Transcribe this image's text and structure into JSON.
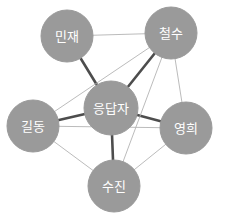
{
  "figure": {
    "type": "network-graph",
    "background_color": "#ffffff",
    "width": 225,
    "height": 224
  },
  "style": {
    "node_fill": "#9a9a9a",
    "node_stroke": "#9a9a9a",
    "node_label_color": "#ffffff",
    "edge_strong_color": "#4d4d4d",
    "edge_weak_color": "#b3b3b3",
    "edge_strong_width": 2.6,
    "edge_weak_width": 0.9
  },
  "chart_data": {
    "type": "network",
    "title": "",
    "nodes": [
      {
        "id": "minjae",
        "label": "민재",
        "x": 67,
        "y": 36,
        "r": 26
      },
      {
        "id": "cheolsu",
        "label": "철수",
        "x": 171,
        "y": 33,
        "r": 26
      },
      {
        "id": "respondent",
        "label": "응답자",
        "x": 111,
        "y": 108,
        "r": 27
      },
      {
        "id": "gildong",
        "label": "길동",
        "x": 33,
        "y": 126,
        "r": 26
      },
      {
        "id": "younghee",
        "label": "영희",
        "x": 186,
        "y": 128,
        "r": 26
      },
      {
        "id": "sujin",
        "label": "수진",
        "x": 114,
        "y": 186,
        "r": 26
      }
    ],
    "edges": [
      {
        "source": "respondent",
        "target": "minjae",
        "weight": "strong"
      },
      {
        "source": "respondent",
        "target": "cheolsu",
        "weight": "strong"
      },
      {
        "source": "respondent",
        "target": "gildong",
        "weight": "strong"
      },
      {
        "source": "respondent",
        "target": "younghee",
        "weight": "strong"
      },
      {
        "source": "respondent",
        "target": "sujin",
        "weight": "strong"
      },
      {
        "source": "minjae",
        "target": "cheolsu",
        "weight": "weak"
      },
      {
        "source": "cheolsu",
        "target": "gildong",
        "weight": "weak"
      },
      {
        "source": "cheolsu",
        "target": "younghee",
        "weight": "weak"
      },
      {
        "source": "cheolsu",
        "target": "sujin",
        "weight": "weak"
      },
      {
        "source": "gildong",
        "target": "younghee",
        "weight": "weak"
      },
      {
        "source": "gildong",
        "target": "sujin",
        "weight": "weak"
      },
      {
        "source": "younghee",
        "target": "sujin",
        "weight": "weak"
      }
    ]
  }
}
